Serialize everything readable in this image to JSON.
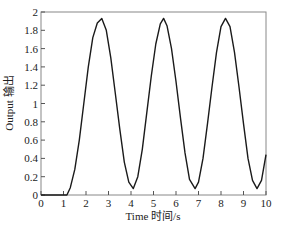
{
  "chart_data": {
    "type": "line",
    "title": "",
    "xlabel": "Time 时间/s",
    "ylabel": "Output 输出",
    "xlim": [
      0,
      10
    ],
    "ylim": [
      0,
      2
    ],
    "grid": false,
    "legend": null,
    "x_ticks": [
      "0",
      "1",
      "2",
      "3",
      "4",
      "5",
      "6",
      "7",
      "8",
      "9",
      "10"
    ],
    "y_ticks": [
      "0",
      "0.2",
      "0.4",
      "0.6",
      "0.8",
      "1",
      "1.2",
      "1.4",
      "1.6",
      "1.8",
      "2"
    ],
    "series": [
      {
        "name": "Output",
        "color": "#1a1a1a",
        "x": [
          0,
          0.5,
          1.0,
          1.15,
          1.3,
          1.5,
          1.7,
          1.9,
          2.1,
          2.3,
          2.5,
          2.7,
          2.9,
          3.1,
          3.3,
          3.5,
          3.7,
          3.9,
          4.1,
          4.3,
          4.5,
          4.7,
          4.9,
          5.1,
          5.3,
          5.45,
          5.6,
          5.8,
          6.0,
          6.2,
          6.4,
          6.6,
          6.85,
          7.0,
          7.2,
          7.4,
          7.6,
          7.8,
          8.0,
          8.2,
          8.4,
          8.6,
          8.8,
          9.0,
          9.2,
          9.4,
          9.6,
          9.8,
          10.0
        ],
        "y": [
          0,
          0,
          0,
          0,
          0.08,
          0.28,
          0.6,
          1.0,
          1.4,
          1.72,
          1.88,
          1.93,
          1.8,
          1.5,
          1.12,
          0.72,
          0.36,
          0.14,
          0.07,
          0.2,
          0.5,
          0.9,
          1.3,
          1.65,
          1.87,
          1.93,
          1.85,
          1.6,
          1.24,
          0.84,
          0.46,
          0.17,
          0.07,
          0.14,
          0.4,
          0.78,
          1.18,
          1.56,
          1.84,
          1.93,
          1.84,
          1.56,
          1.18,
          0.78,
          0.4,
          0.16,
          0.07,
          0.16,
          0.44
        ]
      }
    ]
  }
}
